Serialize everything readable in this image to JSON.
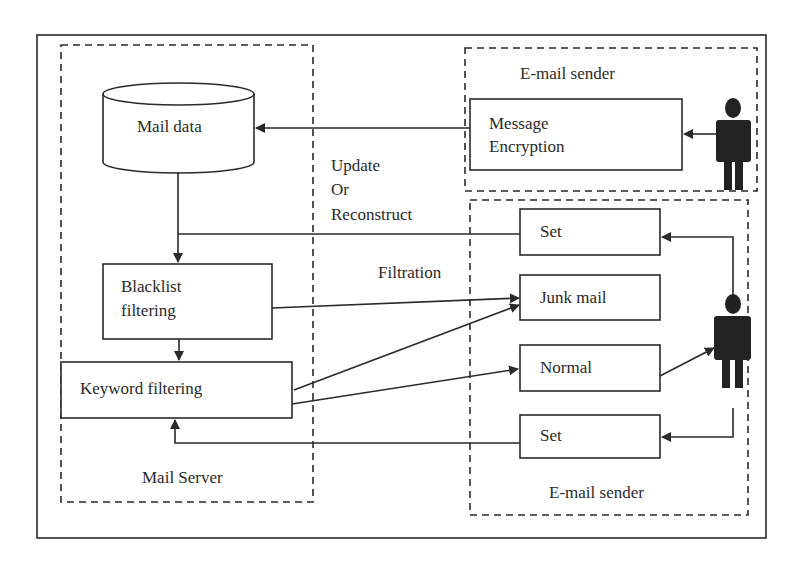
{
  "diagram": {
    "mail_server": {
      "title": "Mail Server",
      "mail_data": "Mail data",
      "blacklist_line1": "Blacklist",
      "blacklist_line2": "filtering",
      "keyword": "Keyword filtering"
    },
    "sender_top": {
      "title": "E-mail sender",
      "encryption_line1": "Message",
      "encryption_line2": "Encryption"
    },
    "sender_bottom": {
      "title": "E-mail sender",
      "set_top": "Set",
      "junk": "Junk mail",
      "normal": "Normal",
      "set_bottom": "Set"
    },
    "annotations": {
      "update_line1": "Update",
      "update_line2": "Or",
      "update_line3": "Reconstruct",
      "filtration": "Filtration"
    },
    "colors": {
      "stroke": "#2a2a2a",
      "background": "#ffffff"
    }
  }
}
